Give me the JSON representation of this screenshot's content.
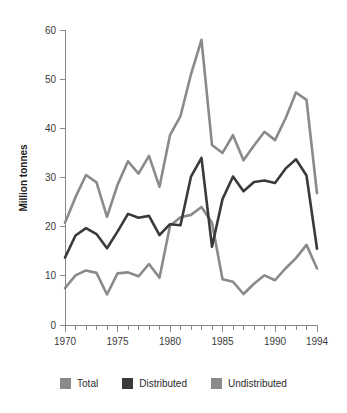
{
  "chart_data": {
    "type": "line",
    "title": "",
    "xlabel": "",
    "ylabel": "Million tonnes",
    "xlim": [
      1970,
      1994
    ],
    "ylim": [
      0,
      60
    ],
    "grid": false,
    "legend_position": "bottom",
    "x_tick_labels": [
      "1970",
      "1975",
      "1980",
      "1985",
      "1990",
      "1994"
    ],
    "x_tick_values": [
      1970,
      1975,
      1980,
      1985,
      1990,
      1994
    ],
    "y_tick_labels": [
      "0",
      "10",
      "20",
      "30",
      "40",
      "50",
      "60"
    ],
    "y_tick_values": [
      0,
      10,
      20,
      30,
      40,
      50,
      60
    ],
    "x": [
      1970,
      1971,
      1972,
      1973,
      1974,
      1975,
      1976,
      1977,
      1978,
      1979,
      1980,
      1981,
      1982,
      1983,
      1984,
      1985,
      1986,
      1987,
      1988,
      1989,
      1990,
      1991,
      1992,
      1993,
      1994
    ],
    "series": [
      {
        "name": "Total",
        "color": "#8a8a8a",
        "values": [
          20.8,
          26.0,
          30.5,
          29.0,
          22.0,
          28.5,
          33.3,
          30.8,
          34.4,
          28.1,
          38.6,
          42.5,
          51.0,
          58.0,
          36.6,
          35.0,
          38.6,
          33.5,
          36.5,
          39.3,
          37.6,
          42.0,
          47.3,
          45.8,
          26.8
        ]
      },
      {
        "name": "Distributed",
        "color": "#3a3a3a",
        "values": [
          13.7,
          18.2,
          19.7,
          18.5,
          15.6,
          19.0,
          22.6,
          21.8,
          22.2,
          18.3,
          20.5,
          20.3,
          30.2,
          34.0,
          15.9,
          25.6,
          30.2,
          27.2,
          29.1,
          29.4,
          28.9,
          31.8,
          33.7,
          30.4,
          15.5
        ]
      },
      {
        "name": "Undistributed",
        "color": "#8a8a8a",
        "values": [
          7.5,
          10.1,
          11.1,
          10.6,
          6.2,
          10.5,
          10.7,
          9.9,
          12.4,
          9.6,
          20.2,
          21.9,
          22.4,
          24.0,
          20.8,
          9.3,
          8.8,
          6.3,
          8.4,
          10.1,
          9.1,
          11.5,
          13.6,
          16.3,
          11.5
        ]
      }
    ]
  },
  "legend": {
    "items": [
      {
        "label": "Total",
        "color": "#8a8a8a"
      },
      {
        "label": "Distributed",
        "color": "#3a3a3a"
      },
      {
        "label": "Undistributed",
        "color": "#8a8a8a"
      }
    ]
  }
}
